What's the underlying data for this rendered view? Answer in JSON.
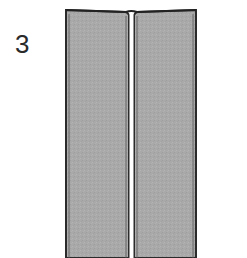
{
  "step": {
    "number": "3"
  },
  "figure": {
    "panel_fill": "#a9a9a9",
    "edge_color": "#2b2b2b",
    "crease_color": "#ffffff"
  }
}
